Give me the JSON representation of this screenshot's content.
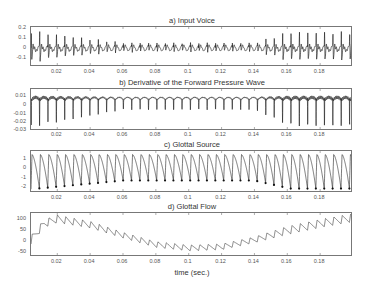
{
  "chart_data": [
    {
      "type": "line",
      "title": "a) Input Voice",
      "xlabel": "",
      "ylabel": "",
      "xlim": [
        0.004,
        0.2
      ],
      "ylim": [
        -0.18,
        0.22
      ],
      "yticks": [
        "0.2",
        "0.1",
        "0",
        "-0.1"
      ],
      "xticks": [
        "0.02",
        "0.04",
        "0.06",
        "0.08",
        "0.1",
        "0.12",
        "0.14",
        "0.16",
        "0.18"
      ],
      "description": "Quasi-periodic voiced speech waveform ~0.2 peak early, decaying to ~0.05 mid (0.06-0.14s), growing to ~0.2 after 0.15s",
      "grid": false
    },
    {
      "type": "line",
      "title": "b) Derivative of the Forward Pressure Wave",
      "xlabel": "",
      "ylabel": "",
      "xlim": [
        0.004,
        0.2
      ],
      "ylim": [
        -0.032,
        0.016
      ],
      "yticks": [
        "0.01",
        "0",
        "-0.01",
        "-0.02",
        "-0.03"
      ],
      "xticks": [
        "0.02",
        "0.04",
        "0.06",
        "0.08",
        "0.1",
        "0.12",
        "0.14",
        "0.16",
        "0.18"
      ],
      "description": "Glottal flow derivative; sharp negative pulses to ~-0.03 early, ~-0.008 mid, ~-0.025 late",
      "grid": false
    },
    {
      "type": "line",
      "title": "c) Glottal Source",
      "xlabel": "",
      "ylabel": "",
      "xlim": [
        0.004,
        0.2
      ],
      "ylim": [
        -2.7,
        1.8
      ],
      "yticks": [
        "1",
        "0",
        "-1",
        "-2"
      ],
      "xticks": [
        "0.02",
        "0.04",
        "0.06",
        "0.08",
        "0.1",
        "0.12",
        "0.14",
        "0.16",
        "0.18"
      ],
      "description": "Periodic glottal source pulses with closure markers (dots) at minima; amplitude ~-2.5 early, ~-1.3 mid, ~-2.5 late",
      "grid": false
    },
    {
      "type": "line",
      "title": "d) Glottal Flow",
      "xlabel": "time (sec.)",
      "ylabel": "",
      "xlim": [
        0.004,
        0.2
      ],
      "ylim": [
        -75,
        105
      ],
      "yticks": [
        "100",
        "50",
        "0",
        "-50"
      ],
      "xticks": [
        "0.02",
        "0.04",
        "0.06",
        "0.08",
        "0.1",
        "0.12",
        "0.14",
        "0.16",
        "0.18"
      ],
      "description": "Glottal flow with ripple; baseline rises to ~80 at 0.02s, falls to ~-45 at 0.1s, rises to ~85 at 0.2s",
      "baseline_points": [
        [
          0.004,
          -10
        ],
        [
          0.012,
          60
        ],
        [
          0.02,
          80
        ],
        [
          0.04,
          55
        ],
        [
          0.06,
          10
        ],
        [
          0.08,
          -30
        ],
        [
          0.1,
          -45
        ],
        [
          0.12,
          -40
        ],
        [
          0.14,
          -10
        ],
        [
          0.16,
          30
        ],
        [
          0.18,
          60
        ],
        [
          0.2,
          85
        ]
      ],
      "grid": false
    }
  ],
  "panels": {
    "a": {
      "title": "a) Input Voice"
    },
    "b": {
      "title": "b) Derivative of the Forward Pressure Wave"
    },
    "c": {
      "title": "c) Glottal Source"
    },
    "d": {
      "title": "d) Glottal Flow"
    }
  },
  "xticks": [
    "0.02",
    "0.04",
    "0.06",
    "0.08",
    "0.1",
    "0.12",
    "0.14",
    "0.16",
    "0.18"
  ],
  "yticks": {
    "a": [
      "0.2",
      "0.1",
      "0",
      "-0.1"
    ],
    "b": [
      "0.01",
      "0",
      "-0.01",
      "-0.02",
      "-0.03"
    ],
    "c": [
      "1",
      "0",
      "-1",
      "-2"
    ],
    "d": [
      "100",
      "50",
      "0",
      "-50"
    ]
  },
  "xlabel": "time (sec.)"
}
